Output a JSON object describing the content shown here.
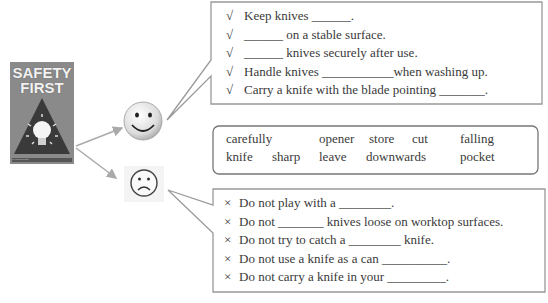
{
  "poster": {
    "title_line1": "SAFETY",
    "title_line2": "FIRST",
    "caption": "Preventing accidents"
  },
  "icons": {
    "happy": "smiley-face",
    "sad": "frowning-face",
    "check": "√",
    "cross": "×"
  },
  "do_list": {
    "items": [
      "Keep knives ______.",
      "______ on a stable surface.",
      "______ knives securely after use.",
      "Handle knives ___________when washing up.",
      "Carry a knife with the blade pointing _______."
    ]
  },
  "word_bank": {
    "row1": [
      "carefully",
      "opener",
      "store",
      "cut",
      "falling"
    ],
    "row2": [
      "knife",
      "sharp",
      "leave",
      "downwards",
      "pocket"
    ]
  },
  "dont_list": {
    "items": [
      "Do not play with a ________.",
      "Do not _______ knives loose on worktop surfaces.",
      "Do not try to catch a ________ knife.",
      "Do not use a knife as a can __________.",
      "Do not carry a knife in your _________."
    ]
  },
  "colors": {
    "border": "#999999",
    "text": "#3a3a3a",
    "arrow": "#aaaaaa"
  }
}
